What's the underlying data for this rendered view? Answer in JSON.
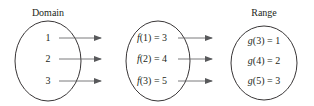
{
  "diagram": {
    "domain": {
      "label": "Domain",
      "items": [
        "1",
        "2",
        "3"
      ]
    },
    "middle": {
      "items": [
        {
          "fn": "f",
          "arg": "(1) = 3"
        },
        {
          "fn": "f",
          "arg": "(2) = 4"
        },
        {
          "fn": "f",
          "arg": "(3) = 5"
        }
      ]
    },
    "range": {
      "label": "Range",
      "items": [
        {
          "fn": "g",
          "arg": "(3) = 1"
        },
        {
          "fn": "g",
          "arg": "(4) = 2"
        },
        {
          "fn": "g",
          "arg": "(5) = 3"
        }
      ]
    },
    "colors": {
      "stroke": "#231f20",
      "arrow": "#58595b"
    }
  }
}
